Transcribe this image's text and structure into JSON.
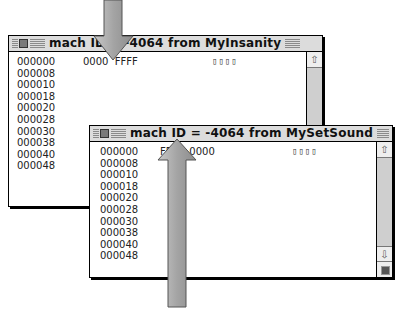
{
  "window_back": {
    "title": "mach ID = -4064 from MyInsanity",
    "addresses": [
      "000000",
      "000008",
      "000010",
      "000018",
      "000020",
      "000028",
      "000030",
      "000038",
      "000040",
      "000048"
    ],
    "hex_line": "0000  FFFF",
    "ascii_line": "▯▯▯▯"
  },
  "window_front": {
    "title": "mach ID = -4064 from MySetSound",
    "addresses": [
      "000000",
      "000008",
      "000010",
      "000018",
      "000020",
      "000028",
      "000030",
      "000038",
      "000040",
      "000048"
    ],
    "hex_line": "FFFF  0000",
    "ascii_line": "▯▯▯▯"
  },
  "scrollbar": {
    "up_arrow": "⇧",
    "down_arrow": "⇩"
  },
  "colors": {
    "titlebar": "#dcdcdc",
    "scroll_track": "#cfcfcf",
    "arrow_fill": "#a9a9a9"
  }
}
